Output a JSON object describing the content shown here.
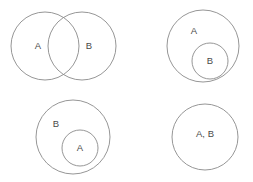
{
  "figure": {
    "background_color": "#ffffff",
    "stroke_color": "#8a8a8a",
    "label_color": "#4a4a4a",
    "panels": [
      {
        "id": "overlapping",
        "name": "overlapping-sets",
        "description": "Two partially overlapping circles",
        "circles": [
          {
            "name": "circle-a",
            "cx": 45,
            "cy": 46,
            "r": 34
          },
          {
            "name": "circle-b",
            "cx": 82,
            "cy": 46,
            "r": 34
          }
        ],
        "labels": [
          {
            "name": "label-a",
            "text": "A",
            "x": 38,
            "y": 46
          },
          {
            "name": "label-b",
            "text": "B",
            "x": 89,
            "y": 46
          }
        ]
      },
      {
        "id": "b-inside-a",
        "name": "b-subset-of-a",
        "description": "Circle B contained inside circle A",
        "circles": [
          {
            "name": "circle-a",
            "cx": 203,
            "cy": 46,
            "r": 36
          },
          {
            "name": "circle-b",
            "cx": 210,
            "cy": 61,
            "r": 18
          }
        ],
        "labels": [
          {
            "name": "label-a",
            "text": "A",
            "x": 194,
            "y": 31
          },
          {
            "name": "label-b",
            "text": "B",
            "x": 210,
            "y": 61
          }
        ]
      },
      {
        "id": "a-inside-b",
        "name": "a-subset-of-b",
        "description": "Circle A contained inside circle B",
        "circles": [
          {
            "name": "circle-b",
            "cx": 73,
            "cy": 137,
            "r": 37
          },
          {
            "name": "circle-a",
            "cx": 80,
            "cy": 148,
            "r": 18
          }
        ],
        "labels": [
          {
            "name": "label-b",
            "text": "B",
            "x": 56,
            "y": 124
          },
          {
            "name": "label-a",
            "text": "A",
            "x": 80,
            "y": 148
          }
        ]
      },
      {
        "id": "identical",
        "name": "identical-sets",
        "description": "Single circle representing A and B as the same set",
        "circles": [
          {
            "name": "circle-ab",
            "cx": 205,
            "cy": 137,
            "r": 33
          }
        ],
        "labels": [
          {
            "name": "label-ab",
            "text": "A, B",
            "x": 205,
            "y": 134
          }
        ]
      }
    ]
  }
}
